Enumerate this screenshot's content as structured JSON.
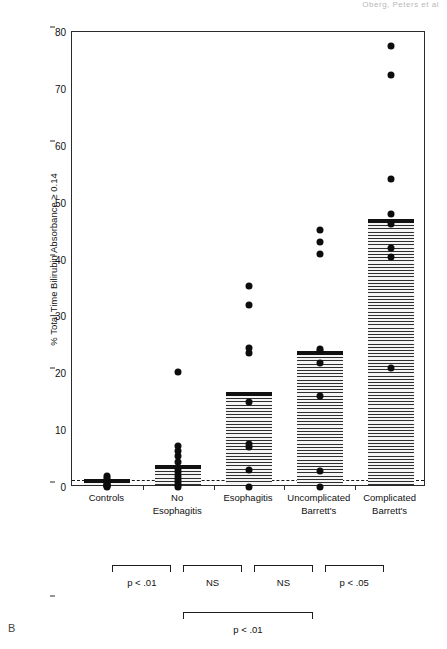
{
  "figure": {
    "panel_label": "B",
    "running_head": "Oberg, Peters et al",
    "axis": {
      "ylabel": "% Total Time Bilirubin Absorbance ≥ 0.14",
      "yticks": [
        0,
        10,
        20,
        30,
        40,
        50,
        60,
        70,
        80
      ],
      "ymin": 0,
      "ymax": 80,
      "reference_line_value": 1.3
    },
    "brackets": [
      {
        "label": "p < .01",
        "from": 0,
        "to": 1,
        "row": 0
      },
      {
        "label": "NS",
        "from": 1,
        "to": 2,
        "row": 0
      },
      {
        "label": "NS",
        "from": 2,
        "to": 3,
        "row": 0
      },
      {
        "label": "p < .05",
        "from": 3,
        "to": 4,
        "row": 0
      },
      {
        "label": "p < .01",
        "from": 1,
        "to": 3,
        "row": 1
      }
    ]
  },
  "chart_data": {
    "type": "bar",
    "title": "",
    "xlabel": "",
    "ylabel": "% Total Time Bilirubin Absorbance ≥ 0.14",
    "ylim": [
      0,
      80
    ],
    "yticks": [
      0,
      10,
      20,
      30,
      40,
      50,
      60,
      70,
      80
    ],
    "grid": false,
    "legend": "none",
    "reference_line": {
      "value": 1.3,
      "style": "dashed"
    },
    "categories": [
      "Controls",
      "No Esophagitis",
      "Esophagitis",
      "Uncomplicated Barrett's",
      "Complicated Barrett's"
    ],
    "category_lines": [
      [
        "Controls"
      ],
      [
        "No",
        "Esophagitis"
      ],
      [
        "Esophagitis"
      ],
      [
        "Uncomplicated",
        "Barrett's"
      ],
      [
        "Complicated",
        "Barrett's"
      ]
    ],
    "series": [
      {
        "name": "Median % time",
        "values": [
          0.5,
          3.0,
          15.8,
          23.0,
          46.2
        ]
      }
    ],
    "scatter_overlay": [
      {
        "category": "Controls",
        "values": [
          0.0,
          0.1,
          0.2,
          0.3,
          0.4,
          0.6,
          0.8,
          1.0,
          1.3,
          1.6,
          2.0
        ]
      },
      {
        "category": "No Esophagitis",
        "values": [
          0.0,
          0.4,
          0.9,
          1.4,
          2.0,
          2.6,
          3.2,
          4.4,
          5.4,
          6.4,
          7.2,
          20.2
        ]
      },
      {
        "category": "Esophagitis",
        "values": [
          0.0,
          3.0,
          7.0,
          7.6,
          15.0,
          23.6,
          24.5,
          32.0,
          35.4
        ]
      },
      {
        "category": "Uncomplicated Barrett's",
        "values": [
          0.0,
          2.8,
          16.0,
          21.8,
          24.0,
          24.2,
          41.0,
          43.0,
          45.2
        ]
      },
      {
        "category": "Complicated Barrett's",
        "values": [
          21.0,
          40.5,
          42.0,
          46.2,
          48.0,
          54.2,
          72.5,
          77.6
        ]
      }
    ],
    "significance": [
      {
        "label": "p < .01",
        "between": [
          "Controls",
          "No Esophagitis"
        ]
      },
      {
        "label": "NS",
        "between": [
          "No Esophagitis",
          "Esophagitis"
        ]
      },
      {
        "label": "NS",
        "between": [
          "Esophagitis",
          "Uncomplicated Barrett's"
        ]
      },
      {
        "label": "p < .05",
        "between": [
          "Uncomplicated Barrett's",
          "Complicated Barrett's"
        ]
      },
      {
        "label": "p < .01",
        "between": [
          "No Esophagitis",
          "Uncomplicated Barrett's"
        ]
      }
    ]
  }
}
